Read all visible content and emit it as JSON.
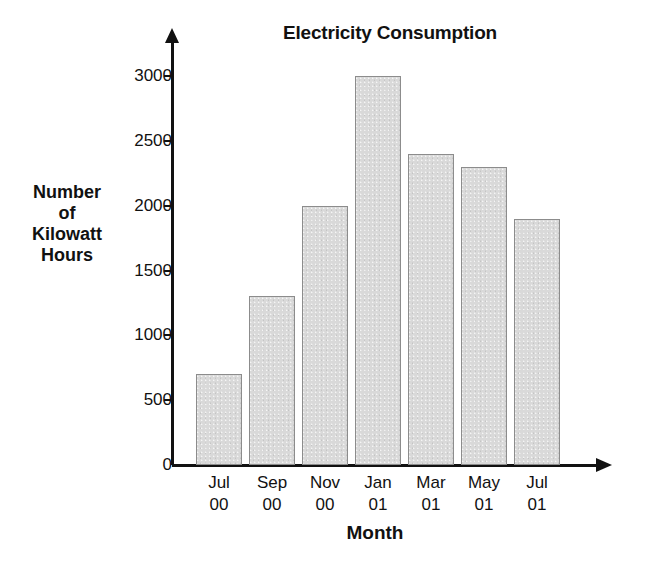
{
  "chart_data": {
    "type": "bar",
    "title": "Electricity Consumption",
    "xlabel": "Month",
    "ylabel": "Number of Kilowatt Hours",
    "ylabel_lines": [
      "Number",
      "of",
      "Kilowatt",
      "Hours"
    ],
    "categories": [
      "Jul 00",
      "Sep 00",
      "Nov 00",
      "Jan 01",
      "Mar 01",
      "May 01",
      "Jul 01"
    ],
    "category_labels": [
      {
        "month": "Jul",
        "year": "00"
      },
      {
        "month": "Sep",
        "year": "00"
      },
      {
        "month": "Nov",
        "year": "00"
      },
      {
        "month": "Jan",
        "year": "01"
      },
      {
        "month": "Mar",
        "year": "01"
      },
      {
        "month": "May",
        "year": "01"
      },
      {
        "month": "Jul",
        "year": "01"
      }
    ],
    "values": [
      700,
      1300,
      2000,
      3000,
      2400,
      2300,
      1900
    ],
    "ylim": [
      0,
      3000
    ],
    "yticks": [
      0,
      500,
      1000,
      1500,
      2000,
      2500,
      3000
    ],
    "ytick_labels": [
      "0",
      "500",
      "1000",
      "1500",
      "2000",
      "2500",
      "3000"
    ],
    "grid": false,
    "legend": null,
    "bar_fill_color": "#d9d9d9",
    "bar_border_color": "#8c8c8c",
    "axis_color": "#111111",
    "text_color": "#111111",
    "background_color": "#ffffff"
  }
}
